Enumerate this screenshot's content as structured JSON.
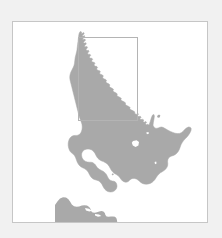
{
  "page": {
    "background_color": "#f1f1f1"
  },
  "map_panel": {
    "name": "map-figure",
    "background_color": "#ffffff",
    "border_color": "#c6c6c6",
    "x": 12,
    "y": 21,
    "width": 196,
    "height": 202
  },
  "map": {
    "region_label": "North Island, New Zealand",
    "land_color": "#a9a9a9",
    "water_color": "#ffffff",
    "lake_color": "#ffffff",
    "inset_rectangle": {
      "label": "Northland study area",
      "stroke_color": "#b4b4b4",
      "x": 65,
      "y": 15,
      "width": 59,
      "height": 83
    },
    "features": [
      {
        "name": "north-island",
        "type": "landmass"
      },
      {
        "name": "south-island-northern-tip",
        "type": "landmass"
      },
      {
        "name": "lake-taupo",
        "type": "lake"
      },
      {
        "name": "lake-wairarapa",
        "type": "lake"
      },
      {
        "name": "great-barrier-island",
        "type": "island"
      },
      {
        "name": "kapiti-island",
        "type": "island"
      }
    ]
  },
  "geometry": {
    "north_island_path": "M126.6,14.2 l1.0,-1.2 0.8,0.4 0.2,1.6 -0.6,1.0 0.9,1.3 1.6,0.5 0.4,1.8 -0.3,1.4 1.5,1.2 1.0,2.2 2.2,1.4 0.7,2.0 1.7,1.2 0.5,2.1 1.5,1.5 2.4,1.0 0.4,1.8 -1.2,0.9 0.6,1.4 2.0,0.6 1.0,1.8 1.9,0.8 0.6,2.0 1.8,1.1 0.8,1.9 1.4,0.9 0.3,1.9 1.9,1.6 1.3,2.2 2.0,1.2 0.8,2.0 1.5,1.3 2.3,1.2 0.6,1.9 1.8,1.3 0.6,1.7 1.9,1.4 0.7,2.1 1.8,1.0 0.9,1.9 1.6,1.3 2.2,0.8 1.0,1.7 -0.4,1.8 1.6,1.0 2.3,0.3 1.4,1.5 0.3,2.0 1.6,0.7 2.0,-0.4 1.8,0.8 1.1,1.6 2.0,0.5 1.9,-0.8 1.6,0.9 0.6,1.8 1.9,0.6 2.0,-0.5 1.8,1.0 1.2,1.7 2.1,0.4 1.2,-1.4 1.8,0.2 1.4,1.5 2.1,0.1 1.6,-1.3 1.2,0.6 0.4,1.9 1.8,0.8 2.2,-0.4 1.5,1.1 0.3,2.1 1.8,0.9 2.3,0.2 1.4,1.3 1.9,0.5 2.1,-0.7 2.0,0.4 1.5,1.4 2.2,0.3 2.0,-0.9 1.9,0.5 1.4,1.5 2.0,0.6 2.2,-0.5 1.9,0.8 1.2,1.6 1.9,0.7 2.2,-0.3 1.6,1.0 0.9,1.8 1.9,0.9 2.0,-0.2 1.4,1.2 0.6,2.0 1.6,1.1 2.0,0.3 1.2,1.5 0.5,2.1 1.4,1.2 1.9,0.6 0.9,1.8 -0.3,2.0 1.2,1.4 1.8,0.9 0.6,1.9 -0.5,2.1 0.9,1.6 1.6,1.2 0.3,2.0 -0.7,2.0 0.6,1.8 1.4,1.4 0.0,2.0 -1.0,1.8 0.3,2.0 1.2,1.6 -0.4,2.0 -1.2,1.6 0.0,2.0 0.9,1.8 -0.8,1.9 -1.4,1.4 -0.3,2.0 0.6,1.9 -1.1,1.7 -1.6,1.2 -0.6,2.0 0.3,1.9 -1.4,1.5 -1.8,1.0 -0.9,1.9 0.0,1.9 -1.6,1.3 -1.9,0.8 -1.2,1.8 -0.3,1.9 -1.8,1.1 -2.0,0.6 -1.5,1.6 -0.6,1.9 -2.0,0.9 -2.1,0.4 -1.7,1.4 -0.9,1.8 -2.1,0.7 -2.2,0.2 -1.9,1.2 -1.2,1.7 -2.2,0.5 -2.3,0.0 -2.0,1.0 -1.5,1.6 -2.3,0.3 -2.3,-0.2 -2.1,0.8 -1.8,1.4 -2.3,0.1 -2.4,-0.4 -2.2,0.6 -2.0,1.2 -2.4,-0.1 -2.4,-0.6 -2.3,0.4 -2.2,1.0 -2.4,-0.3 -2.5,-0.8 -2.3,0.2 -2.4,0.8 -2.4,-0.5 -2.5,-1.0 -2.4,0.0 -2.5,0.6 -2.5,-0.7 -2.5,-1.2 -2.4,-0.2 -2.6,0.4 -2.5,-0.9 -2.5,-1.4 -2.4,-0.4 -2.6,0.2 -2.5,-1.1 -2.4,-1.6 -2.4,-0.6 -2.6,0.0 -2.4,-1.3 -2.3,-1.8 -2.3,-0.8 -2.5,-0.2 -2.3,-1.5 -2.2,-2.0 -2.2,-1.0 -2.4,-0.4 -2.1,-1.7 -2.0,-2.1 -2.0,-1.2 -2.2,-0.6 -1.9,-1.9 -1.8,-2.2 -1.8,-1.4 -2.0,-0.8 -1.6,-2.0 -1.6,-2.3 -1.6,-1.6 -1.8,-1.0 -1.3,-2.1 -1.3,-2.4 -1.4,-1.8 -1.5,-1.2 -1.0,-2.2 -1.0,-2.4 -1.2,-2.0 -1.2,-1.4 -0.7,-2.3 -0.7,-2.5 -0.9,-2.1 -0.9,-1.6 -0.4,-2.3 -0.4,-2.5 -0.6,-2.2 -0.6,-1.8 Z",
    "comment": "Coastline outlines are rendered from the SVG paths in the template; this field is a placeholder descriptor only."
  }
}
